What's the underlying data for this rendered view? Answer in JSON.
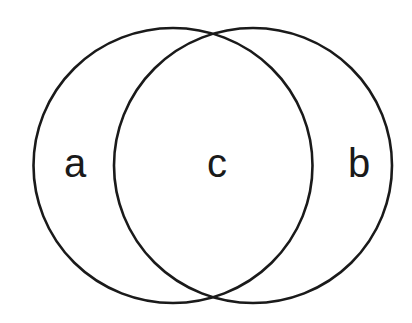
{
  "diagram": {
    "type": "venn",
    "stroke_color": "#1a1a1a",
    "background": "#ffffff",
    "sets": [
      {
        "id": "left",
        "label": "a"
      },
      {
        "id": "right",
        "label": "b"
      }
    ],
    "labels": {
      "left_only": "a",
      "intersection": "c",
      "right_only": "b"
    }
  }
}
